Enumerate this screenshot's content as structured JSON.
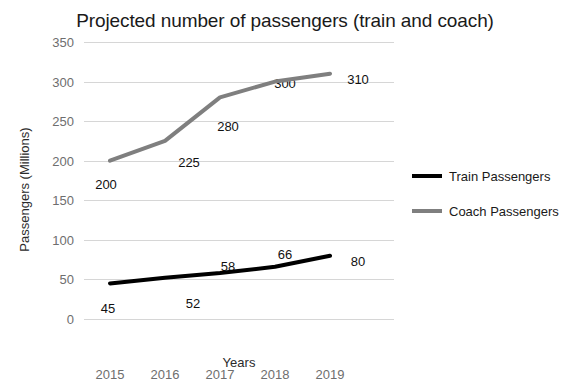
{
  "chart_data": {
    "type": "line",
    "title": "Projected number of passengers (train and coach)",
    "xlabel": "Years",
    "ylabel": "Passengers (Millions)",
    "categories": [
      "2015",
      "2016",
      "2017",
      "2018",
      "2019"
    ],
    "ylim": [
      0,
      350
    ],
    "y_ticks": [
      "0",
      "50",
      "100",
      "150",
      "200",
      "250",
      "300",
      "350"
    ],
    "grid": true,
    "legend_position": "right",
    "series": [
      {
        "name": "Train Passengers",
        "color": "#000000",
        "values": [
          45,
          52,
          58,
          66,
          80
        ],
        "labels": [
          "45",
          "52",
          "58",
          "66",
          "80"
        ]
      },
      {
        "name": "Coach Passengers",
        "color": "#7f7f7f",
        "values": [
          200,
          225,
          280,
          300,
          310
        ],
        "labels": [
          "200",
          "225",
          "280",
          "300",
          "310"
        ]
      }
    ]
  },
  "colors": {
    "train": "#000000",
    "coach": "#7f7f7f",
    "gridline": "#d6d6d6",
    "tick_text": "#6e6e6e",
    "background": "#ffffff"
  }
}
